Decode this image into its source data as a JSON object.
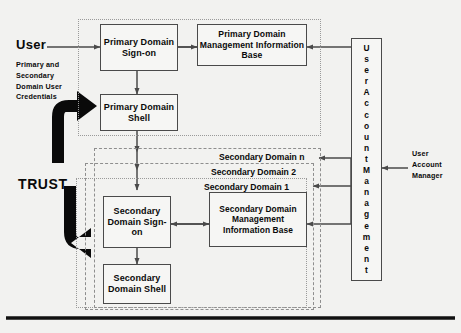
{
  "diagram": {
    "colors": {
      "background": "#f2f2f0",
      "box_fill": "#f6f6f4",
      "box_border": "#4a4a4a",
      "dashed_border": "#8e8e8e",
      "text": "#0a0a0a",
      "arrow": "#4a4a4a",
      "trust_arrow": "#0a0a0a",
      "rule": "#111111"
    }
  },
  "actor": {
    "user_label": "User",
    "credentials_note": "Primary and\nSecondary\nDomain User\nCredentials",
    "trust_label": "TRUST"
  },
  "primary_domain": {
    "signon": "Primary\nDomain\nSign-on",
    "shell": "Primary\nDomain\nShell",
    "mib": "Primary Domain\nManagement\nInformation Base"
  },
  "secondary_domains": {
    "label_n": "Secondary Domain n",
    "label_2": "Secondary Domain 2",
    "label_1": "Secondary Domain 1",
    "signon": "Secondary\nDomain\nSign-on",
    "shell": "Secondary\nDomain\nShell",
    "mib": "Secondary\nDomain\nManagement\nInformation Base"
  },
  "management": {
    "vertical_label": "User Account Management",
    "manager_label": "User\nAccount\nManager"
  }
}
